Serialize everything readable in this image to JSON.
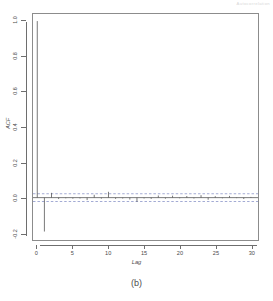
{
  "page_header": "Autocorrelation",
  "figure": {
    "caption": "(b)"
  },
  "axes": {
    "x_title": "Lag",
    "y_title": "ACF",
    "x_ticks": [
      "0",
      "5",
      "10",
      "15",
      "20",
      "25",
      "30"
    ],
    "y_ticks": [
      "1.0",
      "0.8",
      "0.6",
      "0.4",
      "0.2",
      "0.0",
      "-0.2"
    ]
  },
  "colors": {
    "frame": "#8c8c8c",
    "axis": "#6e6e6e",
    "stem": "#555555",
    "confidence_band": "#7a86c0",
    "background": "#ffffff"
  },
  "chart_data": {
    "type": "bar",
    "title": "",
    "subtitle": "",
    "xlabel": "Lag",
    "ylabel": "ACF",
    "xlim": [
      -0.6,
      31
    ],
    "ylim": [
      -0.24,
      1.04
    ],
    "grid": false,
    "legend": null,
    "annotations": [],
    "confidence_level": 0.95,
    "confidence_bounds": [
      0.022,
      -0.022
    ],
    "x": [
      0,
      1,
      2,
      3,
      4,
      5,
      6,
      7,
      8,
      9,
      10,
      11,
      12,
      13,
      14,
      15,
      16,
      17,
      18,
      19,
      20,
      21,
      22,
      23,
      24,
      25,
      26,
      27,
      28,
      29,
      30
    ],
    "values": [
      1.0,
      -0.192,
      0.027,
      -0.008,
      -0.004,
      -0.006,
      -0.005,
      -0.014,
      0.016,
      -0.006,
      0.033,
      -0.007,
      -0.005,
      -0.011,
      -0.024,
      -0.005,
      -0.007,
      0.012,
      -0.006,
      0.011,
      -0.004,
      0.009,
      -0.005,
      0.014,
      -0.012,
      0.008,
      -0.004,
      0.01,
      -0.003,
      -0.008,
      0.004
    ]
  }
}
